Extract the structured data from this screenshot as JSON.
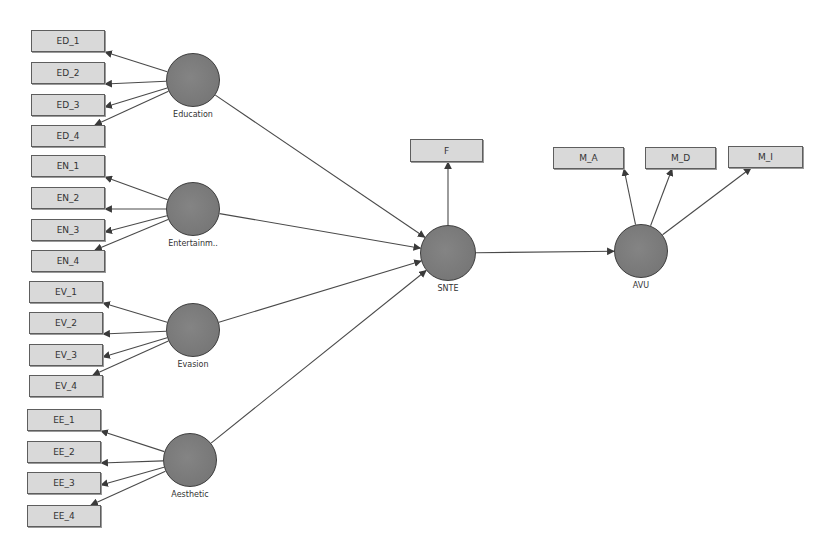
{
  "diagram": {
    "type": "PLS-SEM path model",
    "colors": {
      "indicator_fill": "#d9d9d9",
      "indicator_border": "#5e5e5e",
      "latent_fill": "#7a7a7a",
      "latent_border": "#3c3c3c",
      "edge": "#4a4a4a"
    },
    "latents": [
      {
        "id": "education",
        "label": "Education",
        "cx": 193,
        "cy": 80,
        "r": 27
      },
      {
        "id": "entertainment",
        "label": "Entertainm..",
        "cx": 193,
        "cy": 209,
        "r": 27
      },
      {
        "id": "evasion",
        "label": "Evasion",
        "cx": 193,
        "cy": 330,
        "r": 27
      },
      {
        "id": "aesthetic",
        "label": "Aesthetic",
        "cx": 190,
        "cy": 460,
        "r": 27
      },
      {
        "id": "snte",
        "label": "SNTE",
        "cx": 448,
        "cy": 253,
        "r": 28
      },
      {
        "id": "avu",
        "label": "AVU",
        "cx": 641,
        "cy": 251,
        "r": 27
      }
    ],
    "indicators": [
      {
        "id": "ED_1",
        "label": "ED_1",
        "x": 31,
        "y": 30,
        "w": 74,
        "h": 22,
        "parent": "education"
      },
      {
        "id": "ED_2",
        "label": "ED_2",
        "x": 31,
        "y": 62,
        "w": 74,
        "h": 22,
        "parent": "education"
      },
      {
        "id": "ED_3",
        "label": "ED_3",
        "x": 31,
        "y": 94,
        "w": 74,
        "h": 22,
        "parent": "education"
      },
      {
        "id": "ED_4",
        "label": "ED_4",
        "x": 31,
        "y": 125,
        "w": 74,
        "h": 22,
        "parent": "education"
      },
      {
        "id": "EN_1",
        "label": "EN_1",
        "x": 31,
        "y": 155,
        "w": 74,
        "h": 22,
        "parent": "entertainment"
      },
      {
        "id": "EN_2",
        "label": "EN_2",
        "x": 31,
        "y": 187,
        "w": 74,
        "h": 22,
        "parent": "entertainment"
      },
      {
        "id": "EN_3",
        "label": "EN_3",
        "x": 31,
        "y": 219,
        "w": 74,
        "h": 22,
        "parent": "entertainment"
      },
      {
        "id": "EN_4",
        "label": "EN_4",
        "x": 31,
        "y": 250,
        "w": 74,
        "h": 22,
        "parent": "entertainment"
      },
      {
        "id": "EV_1",
        "label": "EV_1",
        "x": 29,
        "y": 281,
        "w": 74,
        "h": 22,
        "parent": "evasion"
      },
      {
        "id": "EV_2",
        "label": "EV_2",
        "x": 29,
        "y": 312,
        "w": 74,
        "h": 22,
        "parent": "evasion"
      },
      {
        "id": "EV_3",
        "label": "EV_3",
        "x": 29,
        "y": 344,
        "w": 74,
        "h": 22,
        "parent": "evasion"
      },
      {
        "id": "EV_4",
        "label": "EV_4",
        "x": 29,
        "y": 375,
        "w": 74,
        "h": 22,
        "parent": "evasion"
      },
      {
        "id": "EE_1",
        "label": "EE_1",
        "x": 27,
        "y": 409,
        "w": 74,
        "h": 22,
        "parent": "aesthetic"
      },
      {
        "id": "EE_2",
        "label": "EE_2",
        "x": 27,
        "y": 441,
        "w": 74,
        "h": 22,
        "parent": "aesthetic"
      },
      {
        "id": "EE_3",
        "label": "EE_3",
        "x": 27,
        "y": 472,
        "w": 74,
        "h": 22,
        "parent": "aesthetic"
      },
      {
        "id": "EE_4",
        "label": "EE_4",
        "x": 27,
        "y": 505,
        "w": 74,
        "h": 22,
        "parent": "aesthetic"
      },
      {
        "id": "F",
        "label": "F",
        "x": 410,
        "y": 139,
        "w": 73,
        "h": 23,
        "parent": "snte"
      },
      {
        "id": "M_A",
        "label": "M_A",
        "x": 553,
        "y": 147,
        "w": 71,
        "h": 22,
        "parent": "avu"
      },
      {
        "id": "M_D",
        "label": "M_D",
        "x": 645,
        "y": 147,
        "w": 71,
        "h": 22,
        "parent": "avu"
      },
      {
        "id": "M_I",
        "label": "M_I",
        "x": 728,
        "y": 146,
        "w": 75,
        "h": 22,
        "parent": "avu"
      }
    ],
    "structural_paths": [
      {
        "from": "education",
        "to": "snte"
      },
      {
        "from": "entertainment",
        "to": "snte"
      },
      {
        "from": "evasion",
        "to": "snte"
      },
      {
        "from": "aesthetic",
        "to": "snte"
      },
      {
        "from": "snte",
        "to": "avu"
      }
    ]
  }
}
